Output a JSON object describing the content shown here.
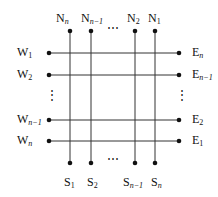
{
  "diagram": {
    "type": "crossbar-grid",
    "line_color": "#333333",
    "dot_color": "#111111",
    "ellipsis": "⋯",
    "vertical_ellipsis": "⋮",
    "north": [
      {
        "base": "N",
        "sub": "n"
      },
      {
        "base": "N",
        "sub": "n−1"
      },
      {
        "base": "N",
        "sub": "2"
      },
      {
        "base": "N",
        "sub": "1"
      }
    ],
    "south": [
      {
        "base": "S",
        "sub": "1"
      },
      {
        "base": "S",
        "sub": "2"
      },
      {
        "base": "S",
        "sub": "n−1"
      },
      {
        "base": "S",
        "sub": "n"
      }
    ],
    "west": [
      {
        "base": "W",
        "sub": "1"
      },
      {
        "base": "W",
        "sub": "2"
      },
      {
        "base": "W",
        "sub": "n−1"
      },
      {
        "base": "W",
        "sub": "n"
      }
    ],
    "east": [
      {
        "base": "E",
        "sub": "n"
      },
      {
        "base": "E",
        "sub": "n−1"
      },
      {
        "base": "E",
        "sub": "2"
      },
      {
        "base": "E",
        "sub": "1"
      }
    ]
  }
}
